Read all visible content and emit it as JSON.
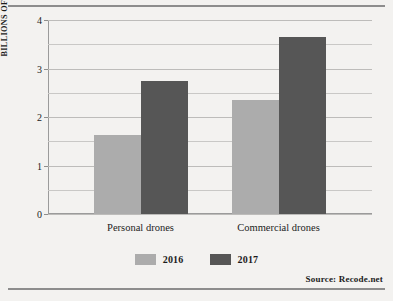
{
  "chart_data": {
    "type": "bar",
    "title": "",
    "xlabel": "",
    "ylabel": "BILLIONS OF DOLLARS",
    "ylim": [
      0,
      4
    ],
    "ytick_labels": [
      "0",
      "1",
      "2",
      "3",
      "4"
    ],
    "ytick_values": [
      0,
      1,
      2,
      3,
      4
    ],
    "gridlines": [
      0,
      0.5,
      1,
      1.5,
      2,
      2.5,
      3,
      3.5,
      4
    ],
    "grid": true,
    "legend_position": "bottom-center",
    "categories": [
      "Personal drones",
      "Commercial drones"
    ],
    "series": [
      {
        "name": "2016",
        "color": "#acacac",
        "values": [
          1.62,
          2.35
        ]
      },
      {
        "name": "2017",
        "color": "#565656",
        "values": [
          2.75,
          3.65
        ]
      }
    ],
    "source_note": "Source:  Recode.net"
  },
  "colors": {
    "background": "#f3f2f0",
    "rule": "#8d8d8d",
    "axis": "#9b9b9b",
    "gridline": "#c9c8c6",
    "text": "#1c1c1c",
    "series_2016": "#acacac",
    "series_2017": "#565656"
  }
}
